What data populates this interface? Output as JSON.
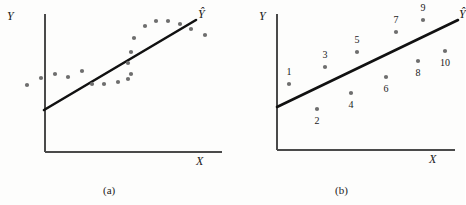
{
  "figure": {
    "background_color": "#fdfdfc",
    "ink_color": "#1a1a1a",
    "dot_color": "#6e6e6e",
    "axis_color": "#4a4a4a"
  },
  "panels": [
    {
      "id": "a",
      "caption": "(a)",
      "y_axis_label": "Y",
      "x_axis_label": "X",
      "line_label": "Ŷ",
      "axes": {
        "x0": 45,
        "y0": 152,
        "x1": 222,
        "ytop": 14
      },
      "fit_line": {
        "x_start": 44,
        "y_start": 110,
        "x_end": 196,
        "y_end": 20
      }
    },
    {
      "id": "b",
      "caption": "(b)",
      "y_axis_label": "Y",
      "x_axis_label": "X",
      "line_label": "Ŷ",
      "axes": {
        "x0": 44,
        "y0": 150,
        "x1": 222,
        "ytop": 14
      },
      "fit_line": {
        "x_start": 44,
        "y_start": 107,
        "x_end": 225,
        "y_end": 20
      }
    }
  ],
  "chart_data": [
    {
      "type": "scatter",
      "panel": "a",
      "title": "(a)",
      "subtitle": "Scatter with autocorrelated residuals about fitted regression line",
      "xlabel": "X",
      "ylabel": "Y",
      "legend": [
        "Ŷ"
      ],
      "grid": false,
      "legend_position": "line-end",
      "series": [
        {
          "name": "observations",
          "points": [
            [
              27,
              85
            ],
            [
              41,
              78
            ],
            [
              55,
              74
            ],
            [
              68,
              77
            ],
            [
              82,
              71
            ],
            [
              92,
              84
            ],
            [
              104,
              84
            ],
            [
              118,
              82
            ],
            [
              128,
              79
            ],
            [
              131,
              74
            ],
            [
              128,
              63
            ],
            [
              131,
              52
            ],
            [
              134,
              38
            ],
            [
              145,
              26
            ],
            [
              156,
              21
            ],
            [
              168,
              21
            ],
            [
              180,
              24
            ],
            [
              191,
              29
            ],
            [
              205,
              35
            ]
          ]
        }
      ],
      "fit_line": {
        "name": "Ŷ",
        "x": [
          44,
          196
        ],
        "y": [
          110,
          20
        ]
      },
      "axis_ranges": {
        "x": [
          45,
          222
        ],
        "y": [
          14,
          152
        ]
      }
    },
    {
      "type": "scatter",
      "panel": "b",
      "title": "(b)",
      "subtitle": "Numbered observations in time order about fitted regression line",
      "xlabel": "X",
      "ylabel": "Y",
      "legend": [
        "Ŷ"
      ],
      "grid": false,
      "legend_position": "line-end",
      "series": [
        {
          "name": "observations",
          "labels": [
            "1",
            "2",
            "3",
            "4",
            "5",
            "6",
            "7",
            "8",
            "9",
            "10"
          ],
          "points": [
            [
              56,
              84
            ],
            [
              84,
              109
            ],
            [
              92,
              67
            ],
            [
              118,
              93
            ],
            [
              124,
              52
            ],
            [
              153,
              77
            ],
            [
              163,
              32
            ],
            [
              185,
              61
            ],
            [
              190,
              20
            ],
            [
              212,
              51
            ]
          ],
          "label_offsets": [
            [
              0,
              -12
            ],
            [
              0,
              12
            ],
            [
              0,
              -12
            ],
            [
              0,
              12
            ],
            [
              0,
              -12
            ],
            [
              0,
              12
            ],
            [
              0,
              -12
            ],
            [
              0,
              12
            ],
            [
              0,
              -12
            ],
            [
              0,
              12
            ]
          ]
        }
      ],
      "fit_line": {
        "name": "Ŷ",
        "x": [
          44,
          225
        ],
        "y": [
          107,
          20
        ]
      },
      "axis_ranges": {
        "x": [
          44,
          222
        ],
        "y": [
          14,
          150
        ]
      }
    }
  ]
}
